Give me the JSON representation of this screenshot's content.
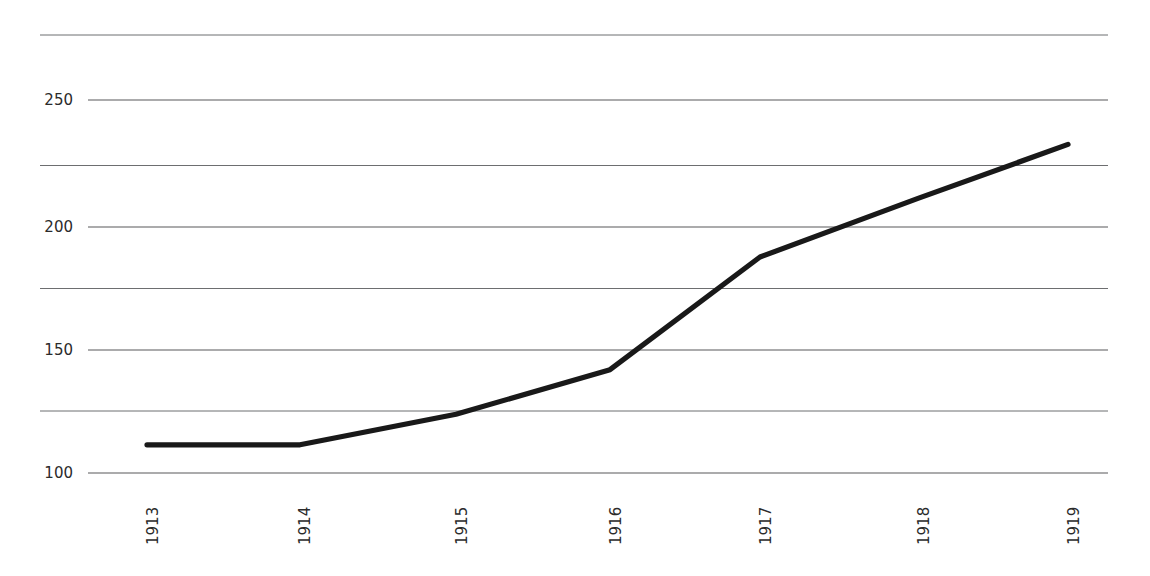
{
  "chart_data": {
    "type": "line",
    "title": "",
    "subtitle": "",
    "xlabel": "",
    "ylabel": "",
    "x": [
      "1913",
      "1914",
      "1915",
      "1916",
      "1917",
      "1918",
      "1919"
    ],
    "categories": [
      "1913",
      "1914",
      "1915",
      "1916",
      "1917",
      "1918",
      "1919"
    ],
    "values": [
      100,
      100,
      113,
      132,
      180,
      205,
      228
    ],
    "series": [
      {
        "name": "index",
        "values": [
          100,
          100,
          113,
          132,
          180,
          205,
          228
        ]
      }
    ],
    "ylim": [
      85,
      281
    ],
    "xlim": [
      "1913",
      "1919"
    ],
    "y_ticks_labeled": [
      "100",
      "150",
      "200",
      "250"
    ],
    "y_tick_values_labeled": [
      100,
      150,
      200,
      250
    ],
    "y_gridline_values": [
      100,
      125,
      150,
      175,
      200,
      225,
      250,
      275
    ],
    "x_tick_labels": [
      "1913",
      "1914",
      "1915",
      "1916",
      "1917",
      "1918",
      "1919"
    ],
    "x_label_rotation_deg": -90,
    "grid": true,
    "grid_axis": "y",
    "legend": false,
    "legend_position": "none",
    "annotations": [],
    "colors": {
      "line": "#191919",
      "gridline_major": "#58595b",
      "gridline_minor": "#6d6e70",
      "background": "#ffffff",
      "tick_text": "#2b2b2b"
    }
  }
}
